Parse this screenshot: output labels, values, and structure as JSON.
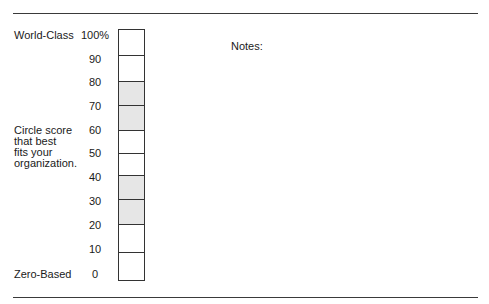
{
  "top_label": "World-Class",
  "bottom_label": "Zero-Based",
  "instruction": [
    "Circle score",
    "that best",
    "fits your",
    "organization."
  ],
  "notes_label": "Notes:",
  "scale": {
    "ticks": [
      "100%",
      "90",
      "80",
      "70",
      "60",
      "50",
      "40",
      "30",
      "20",
      "10",
      "0"
    ],
    "cells": [
      {
        "range": "90-100",
        "shaded": false
      },
      {
        "range": "80-90",
        "shaded": false
      },
      {
        "range": "70-80",
        "shaded": true
      },
      {
        "range": "60-70",
        "shaded": true
      },
      {
        "range": "50-60",
        "shaded": false
      },
      {
        "range": "40-50",
        "shaded": false
      },
      {
        "range": "30-40",
        "shaded": true
      },
      {
        "range": "20-30",
        "shaded": true
      },
      {
        "range": "10-20",
        "shaded": false
      },
      {
        "range": "0-10",
        "shaded": false
      }
    ],
    "shade_color": "#e6e6e6"
  }
}
